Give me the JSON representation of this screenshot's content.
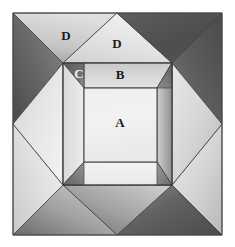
{
  "figure": {
    "canvas": {
      "width": 235,
      "height": 247,
      "background": "#ffffff"
    },
    "outer_square": {
      "x0": 13,
      "y0": 13,
      "x1": 222,
      "y1": 235
    },
    "mid_square": {
      "x0": 63,
      "y0": 63,
      "x1": 172,
      "y1": 185
    },
    "inner_square": {
      "x0": 84,
      "y0": 88,
      "x1": 157,
      "y1": 162
    },
    "labels": [
      {
        "id": "A",
        "text": "A",
        "x": 120,
        "y": 124,
        "tone": "dark"
      },
      {
        "id": "B",
        "text": "B",
        "x": 120,
        "y": 75,
        "tone": "dark"
      },
      {
        "id": "C",
        "text": "C",
        "x": 79,
        "y": 74,
        "tone": "light"
      },
      {
        "id": "D-left",
        "text": "D",
        "x": 66,
        "y": 36,
        "tone": "dark"
      },
      {
        "id": "D-top",
        "text": "D",
        "x": 117,
        "y": 44,
        "tone": "dark"
      }
    ],
    "colors": {
      "stroke": "#3a3a3a",
      "outline": "#555555",
      "very_dark": "#4f4f4f",
      "dark": "#6e6e6e",
      "mid_dark": "#8c8c8c",
      "mid": "#a8a8a8",
      "mid_light": "#c2c2c2",
      "light": "#d8d8d8",
      "very_light": "#ececec",
      "brightest": "#f4f4f4"
    },
    "facets": [
      {
        "id": "outer-top-left-a",
        "label": "D",
        "shading": "dark-to-light"
      },
      {
        "id": "outer-top-left-b",
        "label": "D",
        "shading": "light"
      },
      {
        "id": "outer-top-right-a",
        "label": "D",
        "shading": "light"
      },
      {
        "id": "outer-top-right-b",
        "label": "",
        "shading": "very-dark"
      },
      {
        "id": "outer-right-upper",
        "label": "",
        "shading": "very-dark"
      },
      {
        "id": "outer-right-lower",
        "label": "",
        "shading": "light"
      },
      {
        "id": "outer-bottom-right",
        "label": "",
        "shading": "very-dark"
      },
      {
        "id": "outer-bottom-left",
        "label": "",
        "shading": "light"
      },
      {
        "id": "outer-left-lower",
        "label": "",
        "shading": "light"
      },
      {
        "id": "outer-left-upper",
        "label": "",
        "shading": "light"
      },
      {
        "id": "mid-top",
        "label": "B",
        "shading": "light"
      },
      {
        "id": "mid-corner-c",
        "label": "C",
        "shading": "dark"
      },
      {
        "id": "mid-right",
        "label": "",
        "shading": "mid"
      },
      {
        "id": "mid-bottom",
        "label": "",
        "shading": "very-light"
      },
      {
        "id": "mid-left",
        "label": "",
        "shading": "light"
      },
      {
        "id": "inner-square",
        "label": "A",
        "shading": "brightest"
      }
    ]
  }
}
